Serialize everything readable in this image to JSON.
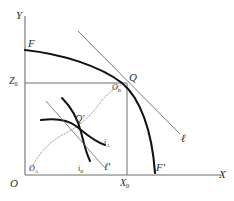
{
  "figure": {
    "background_color": "#ffffff",
    "ink_color": "#2b2b2b",
    "curve_color": "#111111",
    "thin_line_color": "#6d6d6d",
    "dotted_color": "#9a9a9a",
    "width": 234,
    "height": 201
  },
  "axes": {
    "x_label": "X",
    "y_label": "Y",
    "origin_label": "O",
    "x_tick_label": "X",
    "x_tick_sub": "0",
    "y_tick_label": "Z",
    "y_tick_sub": "0"
  },
  "outer": {
    "frontier_start_label": "F",
    "frontier_end_label": "F",
    "frontier_end_prime": "'",
    "tangency_point_label": "Q",
    "price_line_label": "ℓ",
    "box_corner_label": "O",
    "box_corner_sub": "B"
  },
  "inset": {
    "box_origin_label": "O",
    "box_origin_sub": "A",
    "equilibrium_label": "Q",
    "equilibrium_prime": "'",
    "indifference_a_label": "i",
    "indifference_a_sub": "A",
    "indifference_b_label": "i",
    "indifference_b_sub": "B",
    "price_line_label": "ℓ",
    "price_line_prime": "'"
  }
}
